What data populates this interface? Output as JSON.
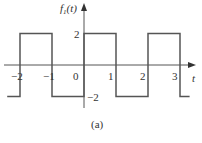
{
  "chart_data": {
    "type": "line",
    "title": "",
    "caption": "(a)",
    "xlabel": "t",
    "ylabel": "f1(t)",
    "ylabel_parts": {
      "base": "f",
      "sub": "1",
      "arg": "(t)"
    },
    "x_ticks": [
      "−2",
      "−1",
      "0",
      "1",
      "2",
      "3"
    ],
    "x_tick_values": [
      -2,
      -1,
      0,
      1,
      2,
      3
    ],
    "y_ticks": [
      "2",
      "−2"
    ],
    "y_tick_values": [
      2,
      -2
    ],
    "xlim": [
      -2.4,
      3.5
    ],
    "ylim": [
      -2.5,
      3
    ],
    "grid": false,
    "legend": null,
    "series": [
      {
        "name": "f1(t)",
        "style": "square wave",
        "period": 2,
        "amplitude": 2,
        "points": [
          [
            -2.4,
            -2
          ],
          [
            -2,
            -2
          ],
          [
            -2,
            2
          ],
          [
            -1,
            2
          ],
          [
            -1,
            -2
          ],
          [
            0,
            -2
          ],
          [
            0,
            2
          ],
          [
            1,
            2
          ],
          [
            1,
            -2
          ],
          [
            2,
            -2
          ],
          [
            2,
            2
          ],
          [
            3,
            2
          ],
          [
            3,
            -2
          ],
          [
            3.3,
            -2
          ]
        ]
      }
    ]
  },
  "colors": {
    "line": "#555555",
    "axis": "#555555",
    "text": "#333333"
  }
}
